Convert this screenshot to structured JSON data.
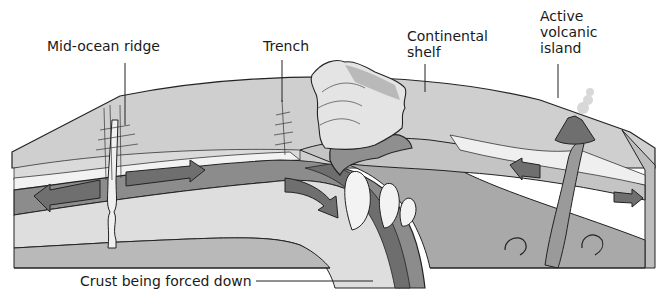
{
  "diagram": {
    "labels": {
      "mid_ocean_ridge": "Mid-ocean ridge",
      "trench": "Trench",
      "continental_shelf_line1": "Continental",
      "continental_shelf_line2": "shelf",
      "volcanic_island_line1": "Active",
      "volcanic_island_line2": "volcanic",
      "volcanic_island_line3": "island",
      "crust_forced_down": "Crust being forced down"
    },
    "icons": {
      "arrows": [
        "arrow-left",
        "arrow-right",
        "arrow-down-right",
        "arrow-left",
        "arrow-right"
      ]
    },
    "colors": {
      "background": "#ffffff",
      "surface_top": "#c9c9c9",
      "ocean_layer": "#d6d6d6",
      "light_band": "#ececec",
      "crust_dark": "#8a8a8a",
      "mantle_mid": "#b4b4b4",
      "mantle_light": "#cfcfcf",
      "magma_light": "#f0f0f0",
      "outline": "#222222",
      "arrow_fill": "#6f6f6f"
    }
  }
}
